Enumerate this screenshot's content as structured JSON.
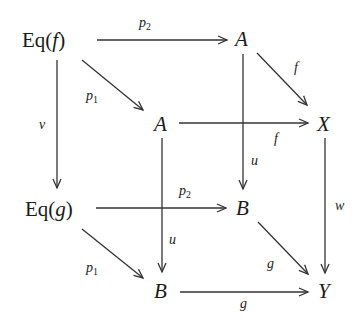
{
  "diagram": {
    "type": "commutative-cube",
    "nodes": {
      "eqf": {
        "label": "Eq(",
        "var": "f",
        "close": ")"
      },
      "a_top": "A",
      "a_mid": "A",
      "x": "X",
      "eqg": {
        "label": "Eq(",
        "var": "g",
        "close": ")"
      },
      "b_mid": "B",
      "b_bot": "B",
      "y": "Y"
    },
    "arrows": [
      {
        "from": "Eq(f)",
        "to": "A",
        "label": "p",
        "sub": "2"
      },
      {
        "from": "Eq(f)",
        "to": "A",
        "label": "p",
        "sub": "1"
      },
      {
        "from": "Eq(f)",
        "to": "Eq(g)",
        "label": "v"
      },
      {
        "from": "A",
        "to": "X",
        "label": "f",
        "id": "top-f"
      },
      {
        "from": "A",
        "to": "X",
        "label": "f",
        "id": "mid-f"
      },
      {
        "from": "A",
        "to": "B",
        "label": "u",
        "id": "top-u"
      },
      {
        "from": "A",
        "to": "B",
        "label": "u",
        "id": "mid-u"
      },
      {
        "from": "X",
        "to": "Y",
        "label": "w"
      },
      {
        "from": "Eq(g)",
        "to": "B",
        "label": "p",
        "sub": "2"
      },
      {
        "from": "Eq(g)",
        "to": "B",
        "label": "p",
        "sub": "1"
      },
      {
        "from": "B",
        "to": "Y",
        "label": "g",
        "id": "diag-g"
      },
      {
        "from": "B",
        "to": "Y",
        "label": "g",
        "id": "bottom-g"
      }
    ]
  }
}
